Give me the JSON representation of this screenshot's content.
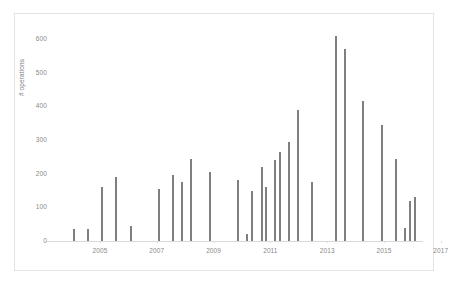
{
  "chart_data": {
    "type": "bar",
    "title": "",
    "subtitle": "",
    "xlabel": "",
    "ylabel": "# operations",
    "ylim": [
      0,
      620
    ],
    "ytick_labels": [
      "600",
      "500",
      "400",
      "300",
      "200",
      "100",
      "0"
    ],
    "ytick_values": [
      600,
      500,
      400,
      300,
      200,
      100,
      0
    ],
    "xtick_labels": [
      "2005",
      "2007",
      "2009",
      "2011",
      "2013",
      "2015",
      "2017"
    ],
    "xtick_values": [
      2005,
      2007,
      2009,
      2011,
      2013,
      2015,
      2017
    ],
    "grid": false,
    "legend": null,
    "bar_color": "#7f7f7f",
    "categories": [
      "2003.75",
      "2004.5",
      "2004.75",
      "2005.0",
      "2005.5",
      "2006.5",
      "2006.75",
      "2007.0",
      "2007.25",
      "2007.75",
      "2008.75",
      "2009.5",
      "2009.75",
      "2010.0",
      "2010.25",
      "2010.75",
      "2011.0",
      "2011.25",
      "2011.75",
      "2012.75",
      "2014.0",
      "2014.5",
      "2014.75",
      "2015.25",
      "2015.75",
      "2016.5",
      "2017.0",
      "2017.25",
      "2017.5"
    ],
    "values": [
      35,
      35,
      160,
      190,
      45,
      155,
      195,
      175,
      245,
      205,
      180,
      20,
      150,
      220,
      160,
      240,
      265,
      295,
      390,
      175,
      610,
      570,
      415,
      345,
      245,
      40,
      120,
      130,
      0
    ],
    "bars": [
      {
        "x_px": 73,
        "value": 35
      },
      {
        "x_px": 87,
        "value": 35
      },
      {
        "x_px": 101,
        "value": 160
      },
      {
        "x_px": 115,
        "value": 190
      },
      {
        "x_px": 130,
        "value": 45
      },
      {
        "x_px": 158,
        "value": 155
      },
      {
        "x_px": 172,
        "value": 195
      },
      {
        "x_px": 181,
        "value": 175
      },
      {
        "x_px": 190,
        "value": 245
      },
      {
        "x_px": 209,
        "value": 205
      },
      {
        "x_px": 237,
        "value": 180
      },
      {
        "x_px": 246,
        "value": 20
      },
      {
        "x_px": 251,
        "value": 150
      },
      {
        "x_px": 261,
        "value": 220
      },
      {
        "x_px": 265,
        "value": 160
      },
      {
        "x_px": 274,
        "value": 240
      },
      {
        "x_px": 279,
        "value": 265
      },
      {
        "x_px": 288,
        "value": 295
      },
      {
        "x_px": 297,
        "value": 390
      },
      {
        "x_px": 311,
        "value": 175
      },
      {
        "x_px": 335,
        "value": 610
      },
      {
        "x_px": 344,
        "value": 570
      },
      {
        "x_px": 362,
        "value": 415
      },
      {
        "x_px": 381,
        "value": 345
      },
      {
        "x_px": 395,
        "value": 245
      },
      {
        "x_px": 404,
        "value": 40
      },
      {
        "x_px": 409,
        "value": 120
      },
      {
        "x_px": 414,
        "value": 130
      }
    ]
  },
  "axis": {
    "y_title": "# operations"
  }
}
